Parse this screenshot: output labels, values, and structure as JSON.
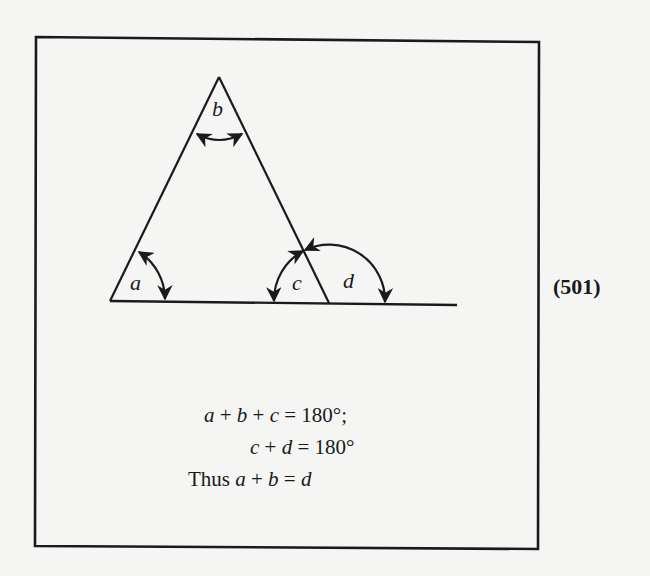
{
  "figure": {
    "number": "(501)",
    "angle_labels": {
      "a": "a",
      "b": "b",
      "c": "c",
      "d": "d"
    },
    "equations": [
      {
        "id": "eq1",
        "text": "a + b + c = 180°;"
      },
      {
        "id": "eq2",
        "text": "c + d = 180°"
      },
      {
        "id": "eq3",
        "text": "Thus a + b = d"
      }
    ],
    "equation_parts": {
      "eq1": {
        "v1": "a",
        "op1": " + ",
        "v2": "b",
        "op2": " + ",
        "v3": "c",
        "rest": " = 180°;"
      },
      "eq2": {
        "v1": "c",
        "op1": " + ",
        "v2": "d",
        "rest": " = 180°"
      },
      "eq3": {
        "prefix": "Thus ",
        "v1": "a",
        "op1": " + ",
        "v2": "b",
        "op2": " = ",
        "v3": "d"
      }
    },
    "colors": {
      "background": "#f5f5f4",
      "ink": "#1a1a1a"
    }
  }
}
